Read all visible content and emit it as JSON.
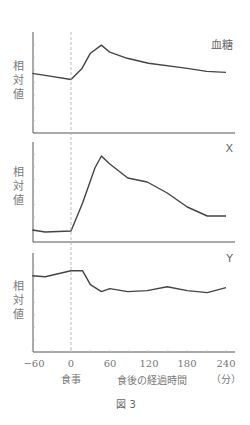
{
  "chart_data": [
    {
      "type": "line",
      "title": "血糖",
      "xlabel": "食後の経過時間（分）",
      "ylabel": "相対値",
      "x": [
        -60,
        -40,
        0,
        17,
        30,
        47,
        60,
        87,
        120,
        180,
        210,
        240
      ],
      "values": [
        59,
        57,
        53,
        64,
        79,
        87,
        80,
        74,
        69,
        64,
        61,
        60
      ],
      "xlim": [
        -60,
        240
      ],
      "ylim": [
        0,
        100
      ],
      "grid": false
    },
    {
      "type": "line",
      "title": "X",
      "xlabel": "食後の経過時間（分）",
      "ylabel": "相対値",
      "x": [
        -60,
        -40,
        0,
        18,
        37,
        47,
        60,
        88,
        118,
        149,
        180,
        211,
        240
      ],
      "values": [
        12,
        10,
        11,
        39,
        74,
        86,
        78,
        64,
        60,
        49,
        35,
        26,
        26
      ],
      "xlim": [
        -60,
        240
      ],
      "ylim": [
        0,
        100
      ],
      "grid": false
    },
    {
      "type": "line",
      "title": "Y",
      "xlabel": "食後の経過時間（分）",
      "ylabel": "相対値",
      "x": [
        -60,
        -40,
        0,
        18,
        30,
        47,
        60,
        88,
        118,
        149,
        180,
        211,
        240
      ],
      "values": [
        77,
        76,
        82,
        82,
        68,
        61,
        64,
        61,
        62,
        66,
        62,
        60,
        65
      ],
      "xlim": [
        -60,
        240
      ],
      "ylim": [
        0,
        100
      ],
      "grid": false
    }
  ],
  "panels": [
    {
      "label": "血糖",
      "ylabel": [
        "相",
        "対",
        "値"
      ]
    },
    {
      "label": "X",
      "ylabel": [
        "相",
        "対",
        "値"
      ]
    },
    {
      "label": "Y",
      "ylabel": [
        "相",
        "対",
        "値"
      ]
    }
  ],
  "x_axis": {
    "ticks": [
      "−60",
      "0",
      "60",
      "120",
      "180",
      "240"
    ],
    "meal_label": "食事",
    "label": "食後の経過時間",
    "unit": "（分）"
  },
  "caption": "図 3",
  "colors": {
    "line": "#444444",
    "axis": "#555555",
    "dashed": "#aaaaaa",
    "text": "#666666"
  }
}
